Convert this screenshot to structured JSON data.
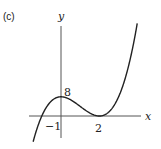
{
  "panel_label": "(c)",
  "chart_data": {
    "type": "line",
    "title": "",
    "xlabel": "x",
    "ylabel": "y",
    "function": "y = 2(x+1)(x-2)^2",
    "x_ticks": [
      {
        "value": -1,
        "label": "−1"
      },
      {
        "value": 2,
        "label": "2"
      }
    ],
    "y_ticks": [
      {
        "value": 8,
        "label": "8"
      }
    ],
    "xlim": [
      -1.6,
      4.2
    ],
    "ylim": [
      -10,
      40
    ],
    "grid": false,
    "series": [
      {
        "name": "curve",
        "x": [
          -1.4,
          -1,
          0,
          1,
          2,
          3,
          4
        ],
        "y": [
          -9.2,
          0,
          8,
          4,
          0,
          8,
          40
        ]
      }
    ]
  },
  "labels": {
    "x_axis": "x",
    "y_axis": "y",
    "tick_neg1": "−1",
    "tick_2": "2",
    "tick_8": "8"
  }
}
